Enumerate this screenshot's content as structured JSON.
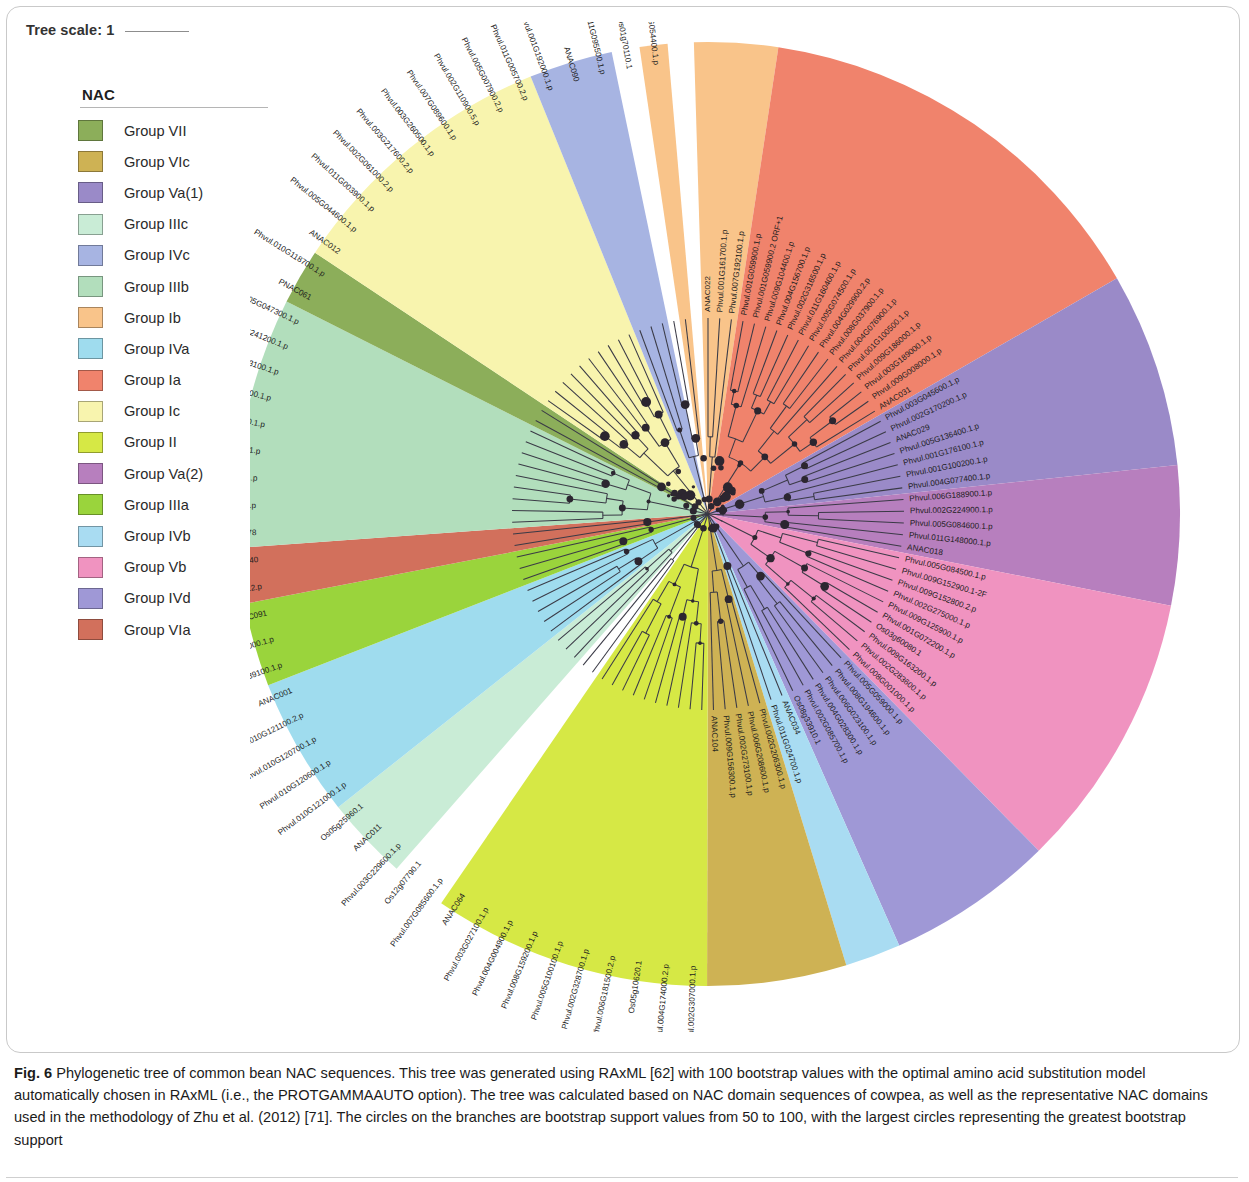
{
  "figure": {
    "tree_scale_label": "Tree scale: 1",
    "caption_bold": "Fig. 6",
    "caption_text": " Phylogenetic tree of common bean NAC sequences. This tree was generated using RAxML [62] with 100 bootstrap values with the optimal amino acid substitution model automatically chosen in RAxML (i.e., the PROTGAMMAAUTO option). The tree was calculated based on NAC domain sequences of cowpea, as well as the representative NAC domains used in the methodology of Zhu et al. (2012) [71]. The circles on the branches are bootstrap support values from 50 to 100, with the largest circles representing the greatest bootstrap support"
  },
  "legend": {
    "title": "NAC",
    "items": [
      {
        "label": "Group VII",
        "color": "#8cae5a"
      },
      {
        "label": "Group VIc",
        "color": "#ceb254"
      },
      {
        "label": "Group Va(1)",
        "color": "#9a8ac8"
      },
      {
        "label": "Group IIIc",
        "color": "#c9ecd6"
      },
      {
        "label": "Group IVc",
        "color": "#a7b4e2"
      },
      {
        "label": "Group IIIb",
        "color": "#aeddа0"
      },
      {
        "label": "Group Ib",
        "color": "#f9c48a"
      },
      {
        "label": "Group IVa",
        "color": "#aee2f0"
      },
      {
        "label": "Group Ia",
        "color": "#f0836c"
      },
      {
        "label": "Group Ic",
        "color": "#f8f4ae"
      },
      {
        "label": "Group II",
        "color": "#d6e845"
      },
      {
        "label": "Group Va(2)",
        "color": "#b77fbe"
      },
      {
        "label": "Group IIIa",
        "color": "#9ad43c"
      },
      {
        "label": "Group IVb",
        "color": "#a9dcf2"
      },
      {
        "label": "Group Vb",
        "color": "#f093c0"
      },
      {
        "label": "Group IVd",
        "color": "#9f98d6"
      },
      {
        "label": "Group VIa",
        "color": "#d2705c"
      }
    ]
  },
  "chart_data": {
    "type": "phylogenetic-radial-tree",
    "title": "Phylogenetic tree of common bean NAC sequences",
    "method": "RAxML",
    "bootstrap_replicates": 100,
    "bootstrap_range": [
      50,
      100
    ],
    "scale": 1,
    "n_tips": 120,
    "group_colors": {
      "Ia": "#f0836c",
      "Ib": "#f9c48a",
      "Ic": "#f8f4ae",
      "II": "#d6e845",
      "IIIa": "#9ad43c",
      "IIIb": "#b2debc",
      "IIIc": "#c9ecd6",
      "IVa": "#9fdcee",
      "IVb": "#a9dcf2",
      "IVc": "#a7b4e2",
      "IVd": "#9f98d6",
      "Va(1)": "#9a8ac8",
      "Va(2)": "#b77fbe",
      "Vb": "#f093c0",
      "VIa": "#d2705c",
      "VIc": "#ceb254",
      "VII": "#8cae5a",
      "none": "#ffffff"
    },
    "tips": [
      {
        "label": "ANAC022",
        "group": "Ib"
      },
      {
        "label": "Phvul.001G161700.1.p",
        "group": "Ib"
      },
      {
        "label": "Phvul.007G192100.1.p",
        "group": "Ib"
      },
      {
        "label": "Phvul.001G059900.1.p",
        "group": "Ia"
      },
      {
        "label": "Phvul.001G059900.2 ORF+1",
        "group": "Ia"
      },
      {
        "label": "Phvul.009G104400.1.p",
        "group": "Ia"
      },
      {
        "label": "Phvul.004G156700.1.p",
        "group": "Ia"
      },
      {
        "label": "Phvul.002G316500.1.p",
        "group": "Ia"
      },
      {
        "label": "Phvul.011G160400.1.p",
        "group": "Ia"
      },
      {
        "label": "Phvul.005G074500.1.p",
        "group": "Ia"
      },
      {
        "label": "Phvul.004G029900.2.p",
        "group": "Ia"
      },
      {
        "label": "Phvul.008G037900.1.p",
        "group": "Ia"
      },
      {
        "label": "Phvul.004G076900.1.p",
        "group": "Ia"
      },
      {
        "label": "Phvul.001G100500.1.p",
        "group": "Ia"
      },
      {
        "label": "Phvul.009G186000.1.p",
        "group": "Ia"
      },
      {
        "label": "Phvul.003G189000.1.p",
        "group": "Ia"
      },
      {
        "label": "Phvul.009G008000.1.p",
        "group": "Ia"
      },
      {
        "label": "ANAC031",
        "group": "Ia"
      },
      {
        "label": "Phvul.003G045600.1.p",
        "group": "Va(1)"
      },
      {
        "label": "Phvul.002G170200.1.p",
        "group": "Va(1)"
      },
      {
        "label": "ANAC029",
        "group": "Va(1)"
      },
      {
        "label": "Phvul.005G136400.1.p",
        "group": "Va(1)"
      },
      {
        "label": "Phvul.001G176100.1.p",
        "group": "Va(1)"
      },
      {
        "label": "Phvul.001G100200.1.p",
        "group": "Va(1)"
      },
      {
        "label": "Phvul.004G077400.1.p",
        "group": "Va(1)"
      },
      {
        "label": "Phvul.006G188900.1.p",
        "group": "Va(2)"
      },
      {
        "label": "Phvul.002G224900.1.p",
        "group": "Va(2)"
      },
      {
        "label": "Phvul.005G084600.1.p",
        "group": "Va(2)"
      },
      {
        "label": "Phvul.011G148000.1.p",
        "group": "Va(2)"
      },
      {
        "label": "ANAC018",
        "group": "Va(2)"
      },
      {
        "label": "Phvul.005G084500.1.p",
        "group": "Vb"
      },
      {
        "label": "Phvul.009G152900.1-2F",
        "group": "Vb"
      },
      {
        "label": "Phvul.009G152800.2.p",
        "group": "Vb"
      },
      {
        "label": "Phvul.002G275000.1.p",
        "group": "Vb"
      },
      {
        "label": "Phvul.009G125900.1.p",
        "group": "Vb"
      },
      {
        "label": "Phvul.001G072200.1.p",
        "group": "Vb"
      },
      {
        "label": "Os03g60080.1",
        "group": "Vb"
      },
      {
        "label": "Phvul.009G163200.1.p",
        "group": "Vb"
      },
      {
        "label": "Phvul.002G283600.1.p",
        "group": "Vb"
      },
      {
        "label": "Phvul.008G001000.1.p",
        "group": "Vb"
      },
      {
        "label": "Phvul.005G059000.1.p",
        "group": "IVd"
      },
      {
        "label": "Phvul.008G194600.1.p",
        "group": "IVd"
      },
      {
        "label": "Phvul.006G023100.1.p",
        "group": "IVd"
      },
      {
        "label": "Phvul.004G028300.1.p",
        "group": "IVd"
      },
      {
        "label": "Phvul.002G085700.1.p",
        "group": "IVd"
      },
      {
        "label": "Os08g33910.1",
        "group": "IVd"
      },
      {
        "label": "ANAC034",
        "group": "IVb"
      },
      {
        "label": "Phvul.011G024700.1.p",
        "group": "IVb"
      },
      {
        "label": "Phvul.002G206300.1.p",
        "group": "VIc"
      },
      {
        "label": "Phvul.006G208600.1.p",
        "group": "VIc"
      },
      {
        "label": "Phvul.002G273100.1.p",
        "group": "VIc"
      },
      {
        "label": "Phvul.009G156300.1.p",
        "group": "VIc"
      },
      {
        "label": "ANAC104",
        "group": "VIc"
      },
      {
        "label": "Phvul.002G307000.1.p",
        "group": "II"
      },
      {
        "label": "Phvul.004G174000.2.p",
        "group": "II"
      },
      {
        "label": "Os05g10620.1",
        "group": "II"
      },
      {
        "label": "Phvul.006G181500.2.p",
        "group": "II"
      },
      {
        "label": "Phvul.002G328700.1.p",
        "group": "II"
      },
      {
        "label": "Phvul.005G100100.1.p",
        "group": "II"
      },
      {
        "label": "Phvul.008G159200.1.p",
        "group": "II"
      },
      {
        "label": "Phvul.004G004900.1.p",
        "group": "II"
      },
      {
        "label": "Phvul.003G027100.1.p",
        "group": "II"
      },
      {
        "label": "ANAC064",
        "group": "II"
      },
      {
        "label": "Phvul.007G085600.1.p",
        "group": "none"
      },
      {
        "label": "Os12g07790.1",
        "group": "none"
      },
      {
        "label": "Phvul.003G229600.1.p",
        "group": "IIIc"
      },
      {
        "label": "ANAC011",
        "group": "IIIc"
      },
      {
        "label": "Os05g25960.1",
        "group": "IIIc"
      },
      {
        "label": "Phvul.010G121000.1.p",
        "group": "IVa"
      },
      {
        "label": "Phvul.010G120600.1.p",
        "group": "IVa"
      },
      {
        "label": "Phvul.010G120700.1.p",
        "group": "IVa"
      },
      {
        "label": "Phvul.010G121100.2.p",
        "group": "IVa"
      },
      {
        "label": "ANAC001",
        "group": "IVa"
      },
      {
        "label": "Phvul.008G189100.1.p",
        "group": "IIIa"
      },
      {
        "label": "Phvul.009G039000.1.p",
        "group": "IIIa"
      },
      {
        "label": "ANAC091",
        "group": "IIIa"
      },
      {
        "label": "Phvul.005G121800.2.p",
        "group": "VIa"
      },
      {
        "label": "ANAC040",
        "group": "VIa"
      },
      {
        "label": "ANAC078",
        "group": "IIIb"
      },
      {
        "label": "Phvul.007G140500.1.p",
        "group": "IIIb"
      },
      {
        "label": "Phvul.007G140332.1.p",
        "group": "IIIb"
      },
      {
        "label": "Phvul.009G150100.1.p",
        "group": "IIIb"
      },
      {
        "label": "Phvul.002G271700.1.p",
        "group": "IIIb"
      },
      {
        "label": "Phvul.006G087000.1.p",
        "group": "IIIb"
      },
      {
        "label": "Phvul.004G143100.1.p",
        "group": "IIIb"
      },
      {
        "label": "Phvul.008G241200.1.p",
        "group": "IIIb"
      },
      {
        "label": "Phvul.005G047300.1.p",
        "group": "IIIb"
      },
      {
        "label": "PNAC061",
        "group": "VII"
      },
      {
        "label": "Phvul.010G118700.1.p",
        "group": "VII"
      },
      {
        "label": "ANAC012",
        "group": "Ic"
      },
      {
        "label": "Phvul.005G044600.1.p",
        "group": "Ic"
      },
      {
        "label": "Phvul.011G003900.1.p",
        "group": "Ic"
      },
      {
        "label": "Phvul.002G061000.2.p",
        "group": "Ic"
      },
      {
        "label": "Phvul.003G217600.2.p",
        "group": "Ic"
      },
      {
        "label": "Phvul.003G260500.1.p",
        "group": "Ic"
      },
      {
        "label": "Phvul.007G089600.1.p",
        "group": "Ic"
      },
      {
        "label": "Phvul.002G110900.5.p",
        "group": "Ic"
      },
      {
        "label": "Phvul.005G007900.2.p",
        "group": "Ic"
      },
      {
        "label": "Phvul.011G005700.2.p",
        "group": "Ic"
      },
      {
        "label": "Phvul.001G192000.1.p",
        "group": "IVc"
      },
      {
        "label": "ANAC090",
        "group": "IVc"
      },
      {
        "label": "Phvul.011G095500.1.p",
        "group": "IVc"
      },
      {
        "label": "Os01g70110.1",
        "group": "none"
      },
      {
        "label": "Phvul.005G054400.1.p",
        "group": "Ib"
      }
    ],
    "wedges": [
      {
        "group": "Ib",
        "start_deg": -110.5,
        "end_deg": -91.0
      },
      {
        "group": "Ia",
        "start_deg": -175.0,
        "end_deg": -110.5
      },
      {
        "group": "Va(1)",
        "start_deg": -175.0,
        "end_deg": -218.0
      },
      {
        "group": "Va(2)",
        "start_deg": -218.0,
        "end_deg": -243.0
      },
      {
        "group": "Vb",
        "start_deg": -243.0,
        "end_deg": -288.0
      },
      {
        "group": "IVd",
        "start_deg": -288.0,
        "end_deg": -315.0
      },
      {
        "group": "IVb",
        "start_deg": -315.0,
        "end_deg": -325.5
      },
      {
        "group": "VIc",
        "start_deg": -325.5,
        "end_deg": -348.0
      },
      {
        "group": "II",
        "start_deg": -348.0,
        "end_deg": -395.0
      },
      {
        "group": "IIIc",
        "start_deg": -404.0,
        "end_deg": -418.5
      },
      {
        "group": "IVa",
        "start_deg": -418.5,
        "end_deg": -442.0
      },
      {
        "group": "IIIa",
        "start_deg": -442.0,
        "end_deg": -456.0
      },
      {
        "group": "VIa",
        "start_deg": -456.0,
        "end_deg": -465.5
      },
      {
        "group": "IIIb",
        "start_deg": -465.5,
        "end_deg": -508.0
      },
      {
        "group": "VII",
        "start_deg": -508.0,
        "end_deg": -517.5
      },
      {
        "group": "Ic",
        "start_deg": -517.5,
        "end_deg": -565.0
      },
      {
        "group": "IVc",
        "start_deg": -565.0,
        "end_deg": -580.0
      }
    ]
  }
}
